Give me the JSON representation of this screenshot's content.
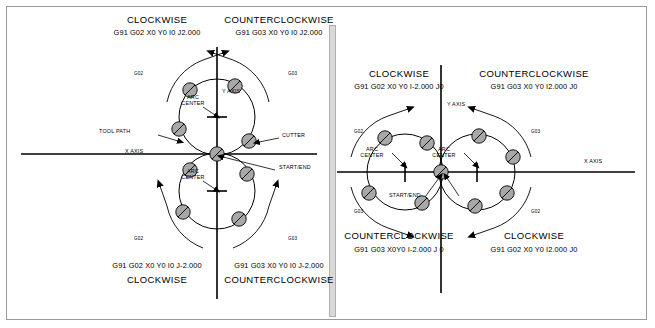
{
  "figure": {
    "title_semantic": "cnc-circular-interpolation-g02-g03-diagram",
    "background": "#ffffff",
    "border_color": "#9a9a9a",
    "divider_color": "#d9d9d9",
    "cutter_fill": "#a8a8a8",
    "line_color": "#000000"
  },
  "left_panel": {
    "name": "j-value-arc-panel",
    "top_left": {
      "direction": "CLOCKWISE",
      "code": "G91 G02 X0 Y0 I0 J2.000"
    },
    "top_right": {
      "direction": "COUNTERCLOCKWISE",
      "code": "G91 G03 X0 Y0 I0 J2.000"
    },
    "bottom_left": {
      "code": "G91 G02 X0 Y0 I0 J-2.000",
      "direction": "CLOCKWISE"
    },
    "bottom_right": {
      "code": "G91 G03 X0 Y0 I0 J-2.000",
      "direction": "COUNTERCLOCKWISE"
    },
    "axis_labels": {
      "x": "X AXIS",
      "y": "Y AXIS"
    },
    "callouts": {
      "tool_path": "TOOL PATH",
      "cutter": "CUTTER",
      "start_end": "START/END",
      "arc_center_upper": "ARC\nCENTER",
      "arc_center_lower": "ARC\nCENTER"
    },
    "arc_tags": {
      "upper_left": "G02",
      "upper_right": "G03",
      "lower_left": "G02",
      "lower_right": "G03"
    }
  },
  "right_panel": {
    "name": "i-value-arc-panel",
    "top_left": {
      "direction": "CLOCKWISE",
      "code": "G91 G02 X0 Y0 I-2.000 J0"
    },
    "top_right": {
      "direction": "COUNTERCLOCKWISE",
      "code": "G91 G03 X0 Y0 I2.000 J0"
    },
    "bottom_left": {
      "direction": "COUNTERCLOCKWISE",
      "code": "G91 G03 X0Y0 I-2.000 J 0"
    },
    "bottom_right": {
      "direction": "CLOCKWISE",
      "code": "G91 G02 X0 Y0 I2.000 J0"
    },
    "axis_labels": {
      "x": "X AXIS",
      "y": "Y AXIS"
    },
    "callouts": {
      "start_end": "START/END",
      "arc_center_left": "ARC\nCENTER",
      "arc_center_right": "ARC\nCENTER"
    },
    "arc_tags": {
      "left_upper": "G02",
      "left_lower": "G03",
      "right_upper": "G03",
      "right_lower": "G02"
    }
  }
}
